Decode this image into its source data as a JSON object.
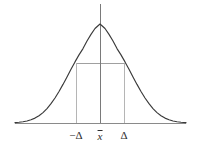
{
  "figure": {
    "background_color": "#ffffff",
    "width": 200,
    "height": 150
  },
  "style": {
    "curve_color": "#3a3a3a",
    "axis_color": "#8a8a8a",
    "center_line_color": "#7a7a7a",
    "drop_line_color": "#b5b5b5",
    "reference_line_color": "#a0a0a0",
    "label_color": "#2e2e2e"
  },
  "labels": {
    "left": "−Δ",
    "center_symbol": "x",
    "center_full": "x̄",
    "right": "Δ"
  },
  "chart_data": {
    "type": "line",
    "title": "",
    "subtitle": "",
    "xlabel": "",
    "ylabel": "",
    "grid": false,
    "legend": null,
    "axis": {
      "x_start_px": 15,
      "x_end_px": 186,
      "baseline_y_px": 123,
      "xlim": [
        -3.4,
        3.4
      ],
      "ylim": [
        0,
        1.0
      ]
    },
    "distribution": {
      "name": "normal",
      "mean": 0,
      "sigma": 1,
      "peak_x_px": 100,
      "peak_y_px": 24,
      "peak_value": 1.0
    },
    "tick_labels": [
      "−Δ",
      "x̄",
      "Δ"
    ],
    "tick_positions_px": [
      76,
      100,
      124
    ],
    "tick_values": [
      -1,
      0,
      1
    ],
    "annotations": [
      {
        "name": "center-axis",
        "kind": "vertical-line",
        "x_px": 100,
        "y_top_px": 4,
        "y_bottom_px": 123
      },
      {
        "name": "left-delta-drop",
        "kind": "vertical-line",
        "x_px": 76,
        "y_top_px": 63,
        "y_bottom_px": 123
      },
      {
        "name": "right-delta-drop",
        "kind": "vertical-line",
        "x_px": 124,
        "y_top_px": 63,
        "y_bottom_px": 123
      },
      {
        "name": "delta-level",
        "kind": "horizontal-line",
        "y_px": 63,
        "x_start_px": 76,
        "x_end_px": 124
      }
    ],
    "curve_points_px": [
      [
        15,
        122.6
      ],
      [
        19,
        122.3
      ],
      [
        23,
        121.8
      ],
      [
        27,
        121.0
      ],
      [
        31,
        119.8
      ],
      [
        35,
        118.1
      ],
      [
        39,
        115.7
      ],
      [
        43,
        112.6
      ],
      [
        47,
        108.6
      ],
      [
        51,
        103.7
      ],
      [
        55,
        98.0
      ],
      [
        59,
        91.5
      ],
      [
        63,
        84.4
      ],
      [
        67,
        76.9
      ],
      [
        71,
        69.3
      ],
      [
        75,
        61.9
      ],
      [
        79,
        54.9
      ],
      [
        83,
        48.6
      ],
      [
        87,
        41.0
      ],
      [
        91,
        34.4
      ],
      [
        95,
        28.5
      ],
      [
        100,
        24.0
      ],
      [
        105,
        28.5
      ],
      [
        109,
        34.4
      ],
      [
        113,
        41.0
      ],
      [
        117,
        48.6
      ],
      [
        121,
        54.9
      ],
      [
        125,
        61.9
      ],
      [
        129,
        69.3
      ],
      [
        133,
        76.9
      ],
      [
        137,
        84.4
      ],
      [
        141,
        91.5
      ],
      [
        145,
        98.0
      ],
      [
        149,
        103.7
      ],
      [
        153,
        108.6
      ],
      [
        157,
        112.6
      ],
      [
        161,
        115.7
      ],
      [
        165,
        118.1
      ],
      [
        169,
        119.8
      ],
      [
        173,
        121.0
      ],
      [
        177,
        121.8
      ],
      [
        181,
        122.3
      ],
      [
        186,
        122.6
      ]
    ]
  }
}
